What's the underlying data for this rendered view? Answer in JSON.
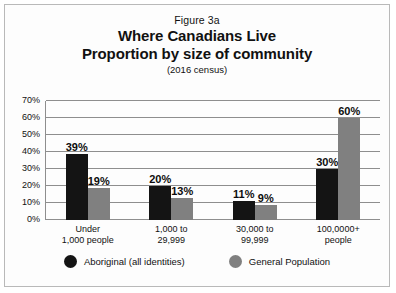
{
  "figure": {
    "number": "Figure 3a",
    "title_line1": "Where Canadians Live",
    "title_line2": "Proportion by size of community",
    "subtitle": "(2016 census)"
  },
  "legend": {
    "items": [
      {
        "label": "Aboriginal (all identities)",
        "color": "#141414",
        "marker": "circle-marker"
      },
      {
        "label": "General Population",
        "color": "#808080",
        "marker": "circle-marker"
      }
    ]
  },
  "chart_data": {
    "type": "bar",
    "subtitle": "(2016 census)",
    "xlabel": "",
    "ylabel": "",
    "ylim": [
      0,
      70
    ],
    "ytick_labels": [
      "0%",
      "10%",
      "20%",
      "30%",
      "40%",
      "50%",
      "60%",
      "70%"
    ],
    "ytick_values": [
      0,
      10,
      20,
      30,
      40,
      50,
      60,
      70
    ],
    "grid": true,
    "legend_position": "bottom",
    "categories": [
      "Under\n1,000 people",
      "1,000 to\n29,999",
      "30,000 to\n99,999",
      "100,0000+\npeople"
    ],
    "category_lines": [
      [
        "Under",
        "1,000 people"
      ],
      [
        "1,000 to",
        "29,999"
      ],
      [
        "30,000 to",
        "99,999"
      ],
      [
        "100,0000+",
        "people"
      ]
    ],
    "series": [
      {
        "name": "Aboriginal (all identities)",
        "color": "#141414",
        "values": [
          39,
          20,
          11,
          30
        ],
        "value_labels": [
          "39%",
          "20%",
          "11%",
          "30%"
        ]
      },
      {
        "name": "General Population",
        "color": "#808080",
        "values": [
          19,
          13,
          9,
          60
        ],
        "value_labels": [
          "19%",
          "13%",
          "9%",
          "60%"
        ]
      }
    ]
  }
}
